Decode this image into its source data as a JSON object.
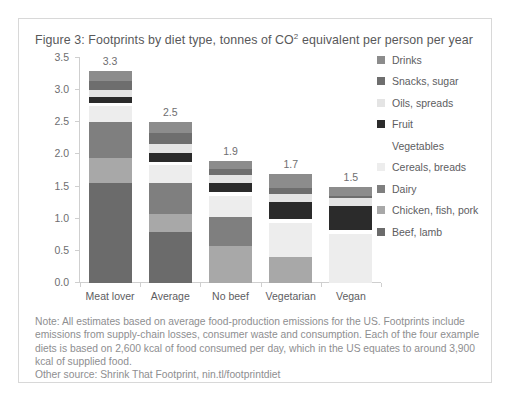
{
  "figure": {
    "title_prefix": "Figure 3: Footprints by diet type, tonnes of CO",
    "title_sup": "2",
    "title_suffix": " equivalent per person per year",
    "title_full": "Figure 3: Footprints by diet type, tonnes of CO2 equivalent per person per year"
  },
  "note": {
    "text": "Note: All estimates based on average food-production emissions for the US. Footprints include emissions from supply-chain losses, consumer waste and consumption. Each of the four example diets is based on 2,600 kcal of food consumed per day, which in the US equates to around 3,900 kcal of supplied food."
  },
  "other_source": {
    "text": "Other source: Shrink That Footprint, nin.tl/footprintdiet"
  },
  "legend": {
    "items": [
      {
        "label": "Drinks",
        "color": "#8c8c8c"
      },
      {
        "label": "Snacks, sugar",
        "color": "#6e6e6e"
      },
      {
        "label": "Oils, spreads",
        "color": "#e4e4e4"
      },
      {
        "label": "Fruit",
        "color": "#2b2b2b"
      },
      {
        "label": "Vegetables",
        "color": "#ffffff"
      },
      {
        "label": "Cereals, breads",
        "color": "#ededed"
      },
      {
        "label": "Dairy",
        "color": "#7f7f7f"
      },
      {
        "label": "Chicken, fish, pork",
        "color": "#a8a8a8"
      },
      {
        "label": "Beef, lamb",
        "color": "#6b6b6b"
      }
    ]
  },
  "chart_data": {
    "type": "bar",
    "subtype": "stacked-bar",
    "title": "Figure 3: Footprints by diet type, tonnes of CO2 equivalent per person per year",
    "xlabel": "",
    "ylabel": "",
    "ylim": [
      0,
      3.5
    ],
    "yticks": [
      "0.0",
      "0.5",
      "1.0",
      "1.5",
      "2.0",
      "2.5",
      "3.0",
      "3.5"
    ],
    "ytick_values": [
      0.0,
      0.5,
      1.0,
      1.5,
      2.0,
      2.5,
      3.0,
      3.5
    ],
    "grid": false,
    "legend_position": "right",
    "categories": [
      "Meat lover",
      "Average",
      "No beef",
      "Vegetarian",
      "Vegan"
    ],
    "totals": [
      3.3,
      2.5,
      1.9,
      1.7,
      1.5
    ],
    "total_labels": [
      "3.3",
      "2.5",
      "1.9",
      "1.7",
      "1.5"
    ],
    "stack_order_bottom_to_top": [
      "Beef, lamb",
      "Chicken, fish, pork",
      "Dairy",
      "Cereals, breads",
      "Vegetables",
      "Fruit",
      "Oils, spreads",
      "Snacks, sugar",
      "Drinks"
    ],
    "series": [
      {
        "name": "Beef, lamb",
        "color": "#6b6b6b",
        "values": [
          1.55,
          0.8,
          0.0,
          0.0,
          0.0
        ]
      },
      {
        "name": "Chicken, fish, pork",
        "color": "#a8a8a8",
        "values": [
          0.4,
          0.28,
          0.57,
          0.4,
          0.0
        ]
      },
      {
        "name": "Dairy",
        "color": "#7f7f7f",
        "values": [
          0.55,
          0.48,
          0.45,
          0.0,
          0.0
        ]
      },
      {
        "name": "Cereals, breads",
        "color": "#ededed",
        "values": [
          0.25,
          0.27,
          0.34,
          0.54,
          0.76
        ]
      },
      {
        "name": "Vegetables",
        "color": "#ffffff",
        "values": [
          0.05,
          0.05,
          0.06,
          0.06,
          0.07
        ]
      },
      {
        "name": "Fruit",
        "color": "#2b2b2b",
        "values": [
          0.1,
          0.14,
          0.14,
          0.26,
          0.37
        ]
      },
      {
        "name": "Oils, spreads",
        "color": "#e4e4e4",
        "values": [
          0.1,
          0.14,
          0.12,
          0.12,
          0.13
        ]
      },
      {
        "name": "Snacks, sugar",
        "color": "#6e6e6e",
        "values": [
          0.15,
          0.17,
          0.1,
          0.1,
          0.02
        ]
      },
      {
        "name": "Drinks",
        "color": "#8c8c8c",
        "values": [
          0.15,
          0.17,
          0.12,
          0.22,
          0.15
        ]
      }
    ]
  }
}
